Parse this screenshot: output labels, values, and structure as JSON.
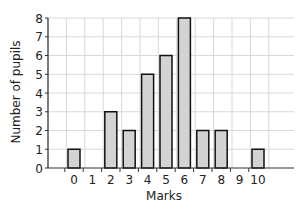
{
  "chart_data": {
    "type": "bar",
    "title": "",
    "xlabel": "Marks",
    "ylabel": "Number of pupils",
    "categories": [
      "0",
      "1",
      "2",
      "3",
      "4",
      "5",
      "6",
      "7",
      "8",
      "9",
      "10"
    ],
    "values": [
      1,
      0,
      3,
      2,
      5,
      6,
      8,
      2,
      2,
      0,
      1
    ],
    "ylim": [
      0,
      8
    ],
    "yticks": [
      0,
      1,
      2,
      3,
      4,
      5,
      6,
      7,
      8
    ],
    "grid": true,
    "legend": null
  },
  "colors": {
    "bar_fill": "#d3d3d3",
    "bar_stroke": "#111111",
    "grid": "#d8d8d8",
    "axis": "#333333"
  }
}
